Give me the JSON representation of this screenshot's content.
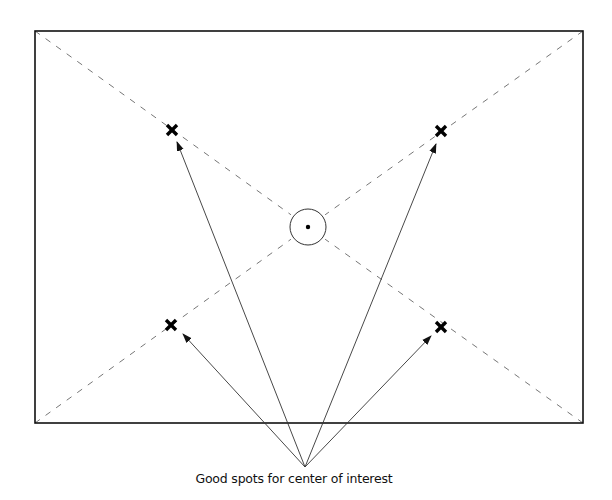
{
  "diagram": {
    "caption": "Good spots for center of interest",
    "frame": {
      "x1": 35,
      "y1": 31,
      "x2": 583,
      "y2": 423
    },
    "center_circle": {
      "cx": 308,
      "cy": 227,
      "r": 18
    },
    "marks": [
      {
        "id": "upper-left",
        "x": 172,
        "y": 130,
        "symbol": "x-mark"
      },
      {
        "id": "upper-right",
        "x": 441,
        "y": 131,
        "symbol": "x-mark"
      },
      {
        "id": "lower-left",
        "x": 171,
        "y": 325,
        "symbol": "x-mark"
      },
      {
        "id": "lower-right",
        "x": 441,
        "y": 327,
        "symbol": "x-mark"
      }
    ],
    "arrow_origin": {
      "x": 305,
      "y": 467
    },
    "arrows": [
      {
        "target": "upper-left",
        "tip_x": 177,
        "tip_y": 142
      },
      {
        "target": "upper-right",
        "tip_x": 436,
        "tip_y": 144
      },
      {
        "target": "lower-left",
        "tip_x": 183,
        "tip_y": 334
      },
      {
        "target": "lower-right",
        "tip_x": 431,
        "tip_y": 336
      }
    ],
    "colors": {
      "frame": "#111111",
      "dashed": "#777777",
      "arrow": "#333333",
      "mark": "#000000"
    }
  }
}
